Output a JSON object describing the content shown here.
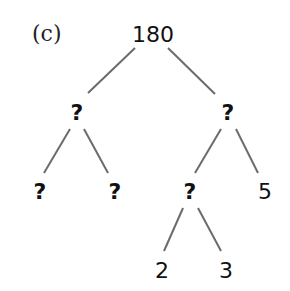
{
  "diagram": {
    "type": "factor-tree",
    "part_label": "(c)",
    "nodes": {
      "root": "180",
      "l": "?",
      "r": "?",
      "ll": "?",
      "lr": "?",
      "rl": "?",
      "rr": "5",
      "rll": "2",
      "rlr": "3"
    },
    "edges": [
      [
        "root",
        "l"
      ],
      [
        "root",
        "r"
      ],
      [
        "l",
        "ll"
      ],
      [
        "l",
        "lr"
      ],
      [
        "r",
        "rl"
      ],
      [
        "r",
        "rr"
      ],
      [
        "rl",
        "rll"
      ],
      [
        "rl",
        "rlr"
      ]
    ],
    "colors": {
      "text": "#111111",
      "line": "#6b6b6b",
      "background": "#ffffff"
    }
  }
}
